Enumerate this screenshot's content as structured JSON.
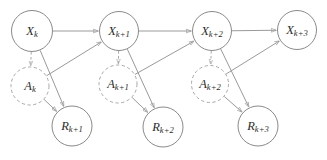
{
  "diagram": {
    "background_color": "#ffffff",
    "edge_color": "#9a9a9a",
    "node_stroke_color": "#8a8a8a",
    "dashed_node_stroke_color": "#a8a8a8",
    "label_color": "#2b2b2b",
    "nodes": [
      {
        "id": "x_k",
        "base": "X",
        "sub": "k",
        "label": "Xₖ",
        "row": "state",
        "style": "solid",
        "cx": 32,
        "cy": 31,
        "r": 20.5
      },
      {
        "id": "x_k1",
        "base": "X",
        "sub": "k+1",
        "label": "Xₖ₊₁",
        "row": "state",
        "style": "solid",
        "cx": 119,
        "cy": 31,
        "r": 19.5
      },
      {
        "id": "x_k2",
        "base": "X",
        "sub": "k+2",
        "label": "Xₖ₊₂",
        "row": "state",
        "style": "solid",
        "cx": 212,
        "cy": 31,
        "r": 19.5
      },
      {
        "id": "x_k3",
        "base": "X",
        "sub": "k+3",
        "label": "Xₖ₊₃",
        "row": "state",
        "style": "solid",
        "cx": 297,
        "cy": 30,
        "r": 19.5
      },
      {
        "id": "a_k",
        "base": "A",
        "sub": "k",
        "label": "Aₖ",
        "row": "action",
        "style": "dashed",
        "cx": 30,
        "cy": 86,
        "r": 19
      },
      {
        "id": "a_k1",
        "base": "A",
        "sub": "k+1",
        "label": "Aₖ₊₁",
        "row": "action",
        "style": "dashed",
        "cx": 118,
        "cy": 84,
        "r": 19
      },
      {
        "id": "a_k2",
        "base": "A",
        "sub": "k+2",
        "label": "Aₖ₊₂",
        "row": "action",
        "style": "dashed",
        "cx": 210,
        "cy": 84,
        "r": 18.5
      },
      {
        "id": "r_k1",
        "base": "R",
        "sub": "k+1",
        "label": "Rₖ₊₁",
        "row": "reward",
        "style": "solid",
        "cx": 72,
        "cy": 126,
        "r": 20
      },
      {
        "id": "r_k2",
        "base": "R",
        "sub": "k+2",
        "label": "Rₖ₊₂",
        "row": "reward",
        "style": "solid",
        "cx": 163,
        "cy": 127,
        "r": 20
      },
      {
        "id": "r_k3",
        "base": "R",
        "sub": "k+3",
        "label": "Rₖ₊₃",
        "row": "reward",
        "style": "solid",
        "cx": 258,
        "cy": 126,
        "r": 20
      }
    ],
    "edges": [
      {
        "from": "x_k",
        "to": "x_k1",
        "style": "solid",
        "kind": "state-transition"
      },
      {
        "from": "x_k1",
        "to": "x_k2",
        "style": "solid",
        "kind": "state-transition"
      },
      {
        "from": "x_k2",
        "to": "x_k3",
        "style": "solid",
        "kind": "state-transition"
      },
      {
        "from": "x_k",
        "to": "a_k",
        "style": "dashed",
        "kind": "policy"
      },
      {
        "from": "x_k1",
        "to": "a_k1",
        "style": "dashed",
        "kind": "policy"
      },
      {
        "from": "x_k2",
        "to": "a_k2",
        "style": "dashed",
        "kind": "policy"
      },
      {
        "from": "a_k",
        "to": "x_k1",
        "style": "solid",
        "kind": "action-effect"
      },
      {
        "from": "a_k1",
        "to": "x_k2",
        "style": "solid",
        "kind": "action-effect"
      },
      {
        "from": "a_k2",
        "to": "x_k3",
        "style": "solid",
        "kind": "action-effect"
      },
      {
        "from": "x_k",
        "to": "r_k1",
        "style": "solid",
        "kind": "reward"
      },
      {
        "from": "x_k1",
        "to": "r_k2",
        "style": "solid",
        "kind": "reward"
      },
      {
        "from": "x_k2",
        "to": "r_k3",
        "style": "solid",
        "kind": "reward"
      },
      {
        "from": "a_k",
        "to": "r_k1",
        "style": "solid",
        "kind": "reward"
      },
      {
        "from": "a_k1",
        "to": "r_k2",
        "style": "solid",
        "kind": "reward"
      },
      {
        "from": "a_k2",
        "to": "r_k3",
        "style": "solid",
        "kind": "reward"
      }
    ]
  }
}
